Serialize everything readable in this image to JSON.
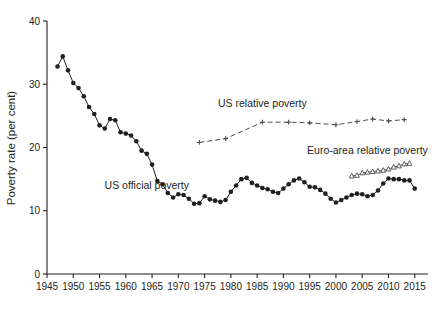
{
  "chart_data": {
    "type": "line",
    "title": "",
    "xlabel": "",
    "ylabel": "Poverty rate (per cent)",
    "xlim": [
      1945,
      2016
    ],
    "ylim": [
      0,
      40
    ],
    "yticks": [
      0,
      10,
      20,
      30,
      40
    ],
    "xticks": [
      1945,
      1950,
      1955,
      1960,
      1965,
      1970,
      1975,
      1980,
      1985,
      1990,
      1995,
      2000,
      2005,
      2010,
      2015
    ],
    "grid": false,
    "legend_position": "inline-annotations",
    "annotations": [
      {
        "text": "US relative poverty",
        "x": 1986,
        "y": 26.4
      },
      {
        "text": "Euro-area relative poverty",
        "x": 2006,
        "y": 19.0
      },
      {
        "text": "US official poverty",
        "x": 1964,
        "y": 13.4
      }
    ],
    "series": [
      {
        "name": "US official poverty",
        "marker": "filled-circle",
        "linestyle": "solid",
        "color": "#231f20",
        "x": [
          1947,
          1948,
          1949,
          1950,
          1951,
          1952,
          1953,
          1954,
          1955,
          1956,
          1957,
          1958,
          1959,
          1960,
          1961,
          1962,
          1963,
          1964,
          1965,
          1966,
          1967,
          1968,
          1969,
          1970,
          1971,
          1972,
          1973,
          1974,
          1975,
          1976,
          1977,
          1978,
          1979,
          1980,
          1981,
          1982,
          1983,
          1984,
          1985,
          1986,
          1987,
          1988,
          1989,
          1990,
          1991,
          1992,
          1993,
          1994,
          1995,
          1996,
          1997,
          1998,
          1999,
          2000,
          2001,
          2002,
          2003,
          2004,
          2005,
          2006,
          2007,
          2008,
          2009,
          2010,
          2011,
          2012,
          2013,
          2014,
          2015
        ],
        "y": [
          32.8,
          34.4,
          32.2,
          30.2,
          29.4,
          28.1,
          26.4,
          25.3,
          23.5,
          23.0,
          24.5,
          24.3,
          22.4,
          22.2,
          21.9,
          21.0,
          19.5,
          19.0,
          17.3,
          14.7,
          14.2,
          12.8,
          12.1,
          12.6,
          12.5,
          11.9,
          11.1,
          11.2,
          12.3,
          11.8,
          11.6,
          11.4,
          11.7,
          13.0,
          14.0,
          15.0,
          15.2,
          14.4,
          14.0,
          13.6,
          13.4,
          13.0,
          12.8,
          13.5,
          14.2,
          14.8,
          15.1,
          14.5,
          13.8,
          13.7,
          13.3,
          12.7,
          11.9,
          11.3,
          11.7,
          12.1,
          12.5,
          12.7,
          12.6,
          12.3,
          12.5,
          13.2,
          14.3,
          15.1,
          15.0,
          15.0,
          14.8,
          14.8,
          13.5
        ]
      },
      {
        "name": "US relative poverty",
        "marker": "plus",
        "linestyle": "dashed",
        "color": "#4d4d4d",
        "x": [
          1974,
          1979,
          1986,
          1991,
          1995,
          2000,
          2004,
          2007,
          2010,
          2013
        ],
        "y": [
          20.8,
          21.4,
          24.0,
          24.0,
          23.9,
          23.6,
          24.1,
          24.5,
          24.2,
          24.4
        ]
      },
      {
        "name": "Euro-area relative poverty",
        "marker": "open-triangle",
        "linestyle": "solid-thin",
        "color": "#4d4d4d",
        "x": [
          2003,
          2004,
          2005,
          2006,
          2007,
          2008,
          2009,
          2010,
          2011,
          2012,
          2013,
          2014
        ],
        "y": [
          15.5,
          15.6,
          16.0,
          16.1,
          16.2,
          16.3,
          16.4,
          16.6,
          16.9,
          17.1,
          17.4,
          17.5
        ]
      }
    ]
  }
}
